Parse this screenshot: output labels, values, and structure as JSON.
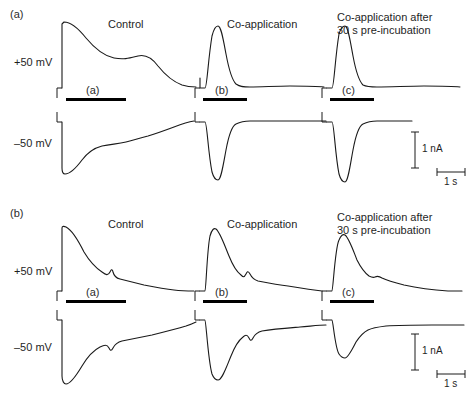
{
  "figure": {
    "width": 473,
    "height": 396,
    "background": "#ffffff",
    "trace_color": "#1a1a1a",
    "bar_color": "#000000"
  },
  "panels": [
    {
      "id": "panel-a",
      "label": "(a)",
      "label_x": 10,
      "label_y": 8,
      "voltage_labels": [
        {
          "text": "+50 mV",
          "x": 14,
          "y": 56
        },
        {
          "text": "–50 mV",
          "x": 14,
          "y": 137
        }
      ],
      "columns": [
        {
          "id": "column-control",
          "title": "Control",
          "title_x": 108,
          "title_y": 18,
          "title_lines": [
            "Control"
          ],
          "application_bar": {
            "x": 66,
            "y": 98,
            "width": 60,
            "label": "(a)",
            "label_x": 86,
            "label_y": 84
          }
        },
        {
          "id": "column-coapplication",
          "title": "Co-application",
          "title_x": 227,
          "title_y": 18,
          "title_lines": [
            "Co-application"
          ],
          "application_bar": {
            "x": 203,
            "y": 98,
            "width": 44,
            "label": "(b)",
            "label_x": 215,
            "label_y": 84
          }
        },
        {
          "id": "column-coapplication-preincubation",
          "title": "Co-application after 30 s pre-incubation",
          "title_x": 337,
          "title_y": 11,
          "title_lines": [
            "Co-application after",
            "30 s pre-incubation"
          ],
          "application_bar": {
            "x": 330,
            "y": 98,
            "width": 44,
            "label": "(c)",
            "label_x": 342,
            "label_y": 84
          }
        }
      ],
      "scale_bars": {
        "current": {
          "label": "1 nA",
          "x": 415,
          "y1": 132,
          "y2": 168,
          "label_x": 422,
          "label_y": 143
        },
        "time": {
          "label": "1 s",
          "x1": 437,
          "x2": 465,
          "y": 172,
          "label_x": 444,
          "label_y": 176
        }
      }
    },
    {
      "id": "panel-b",
      "label": "(b)",
      "label_x": 10,
      "label_y": 207,
      "voltage_labels": [
        {
          "text": "+50 mV",
          "x": 14,
          "y": 265
        },
        {
          "text": "–50 mV",
          "x": 14,
          "y": 341
        }
      ],
      "columns": [
        {
          "id": "column-control",
          "title": "Control",
          "title_x": 108,
          "title_y": 218,
          "title_lines": [
            "Control"
          ],
          "application_bar": {
            "x": 66,
            "y": 300,
            "width": 60,
            "label": "(a)",
            "label_x": 86,
            "label_y": 286
          }
        },
        {
          "id": "column-coapplication",
          "title": "Co-application",
          "title_x": 227,
          "title_y": 218,
          "title_lines": [
            "Co-application"
          ],
          "application_bar": {
            "x": 203,
            "y": 300,
            "width": 44,
            "label": "(b)",
            "label_x": 215,
            "label_y": 286
          }
        },
        {
          "id": "column-coapplication-preincubation",
          "title": "Co-application after 30 s pre-incubation",
          "title_x": 337,
          "title_y": 211,
          "title_lines": [
            "Co-application after",
            "30 s pre-incubation"
          ],
          "application_bar": {
            "x": 330,
            "y": 300,
            "width": 44,
            "label": "(c)",
            "label_x": 342,
            "label_y": 286
          }
        }
      ],
      "scale_bars": {
        "current": {
          "label": "1 nA",
          "x": 415,
          "y1": 334,
          "y2": 370,
          "label_x": 422,
          "label_y": 345
        },
        "time": {
          "label": "1 s",
          "x1": 437,
          "x2": 465,
          "y": 374,
          "label_x": 444,
          "label_y": 378
        }
      }
    }
  ],
  "chart_data": {
    "type": "line",
    "xlabel": "Time",
    "ylabel": "Current",
    "grid": false,
    "legend": null,
    "scale_reference": {
      "current": "1 nA",
      "time": "1 s"
    },
    "annotations": [
      "(a) panel row 1",
      "(b) panel row 2",
      "Application bars labelled (a), (b), (c)"
    ],
    "series": [
      {
        "name": "panel-a-control-plus50",
        "panel": "(a)",
        "column": "Control",
        "holding_potential": "+50 mV",
        "polarity": "outward",
        "baseline_y": 88,
        "peak_y": 22,
        "path": "M 62 88 L 62 24 L 64 22 C 70 22 78 28 86 38 C 96 50 104 56 114 58 C 124 60 130 58 138 56 C 146 54 152 58 158 66 C 166 76 174 82 182 85 C 188 87 190 87 196 87"
      },
      {
        "name": "panel-a-control-minus50",
        "panel": "(a)",
        "column": "Control",
        "holding_potential": "−50 mV",
        "polarity": "inward",
        "baseline_y": 122,
        "peak_y": 174,
        "path": "M 62 122 L 62 168 C 62 172 63 174 65 174 C 70 174 76 168 82 160 C 88 152 94 148 102 146 C 112 144 118 144 126 142 C 134 140 140 138 148 136 C 158 133 166 130 174 127 C 182 124 188 122 194 121"
      },
      {
        "name": "panel-a-coapp-plus50",
        "panel": "(a)",
        "column": "Co-application",
        "holding_potential": "+50 mV",
        "polarity": "outward",
        "baseline_y": 88,
        "peak_y": 26,
        "path": "M 200 88 L 200 78 M 200 88 L 205 88 C 207 88 208 60 212 36 C 214 28 216 26 218 26 C 221 26 223 38 226 54 C 229 70 232 80 236 84 C 240 87 244 87 250 87 C 262 87 276 86 290 86 C 304 86 316 86 324 87"
      },
      {
        "name": "panel-a-coapp-minus50",
        "panel": "(a)",
        "column": "Co-application",
        "holding_potential": "−50 mV",
        "polarity": "inward",
        "baseline_y": 122,
        "peak_y": 180,
        "path": "M 200 122 L 205 122 C 207 122 208 152 212 172 C 214 179 216 180 218 180 C 221 180 223 166 226 150 C 229 134 232 126 236 124 C 240 122 244 121 250 121 C 264 121 280 121 296 121 C 310 121 320 121 326 121"
      },
      {
        "name": "panel-a-preinc-plus50",
        "panel": "(a)",
        "column": "Co-application after 30 s pre-incubation",
        "holding_potential": "+50 mV",
        "polarity": "outward",
        "baseline_y": 88,
        "peak_y": 26,
        "path": "M 327 88 L 332 88 C 334 88 335 58 339 34 C 341 27 343 26 345 26 C 348 26 350 40 353 56 C 356 72 359 81 363 85 C 367 87 371 87 377 87 C 392 87 408 86 424 86 C 440 86 452 86 460 87"
      },
      {
        "name": "panel-a-preinc-minus50",
        "panel": "(a)",
        "column": "Co-application after 30 s pre-incubation",
        "holding_potential": "−50 mV",
        "polarity": "inward",
        "baseline_y": 122,
        "peak_y": 182,
        "path": "M 327 122 L 332 122 C 334 122 335 154 339 174 C 341 181 343 182 345 182 C 348 182 350 166 353 150 C 356 134 359 126 363 124 C 367 122 371 121 377 121 C 392 121 406 121 412 121"
      },
      {
        "name": "panel-b-control-plus50",
        "panel": "(b)",
        "column": "Control",
        "holding_potential": "+50 mV",
        "polarity": "outward",
        "baseline_y": 291,
        "peak_y": 226,
        "path": "M 62 291 L 62 228 C 62 226 64 226 66 227 C 72 230 78 240 84 252 C 90 262 96 268 102 272 C 106 275 108 276 110 272 C 111 270 112 268 113 272 C 114 276 116 278 120 279 C 128 281 136 283 144 285 C 154 287 164 289 174 290 C 182 291 188 291 194 291"
      },
      {
        "name": "panel-b-control-minus50",
        "panel": "(b)",
        "column": "Control",
        "holding_potential": "−50 mV",
        "polarity": "inward",
        "baseline_y": 320,
        "peak_y": 384,
        "path": "M 62 320 L 62 376 C 62 381 64 384 66 384 C 70 384 76 376 82 366 C 88 356 94 350 100 347 C 104 345 107 344 109 348 C 110 350 111 352 113 348 C 115 344 118 342 122 341 C 132 339 142 337 152 335 C 164 332 176 329 186 326 C 192 324 194 323 196 322"
      },
      {
        "name": "panel-b-coapp-plus50",
        "panel": "(b)",
        "column": "Co-application",
        "holding_potential": "+50 mV",
        "polarity": "outward",
        "baseline_y": 291,
        "peak_y": 228,
        "path": "M 200 291 L 205 291 C 206 291 207 250 210 236 C 212 229 214 228 216 229 C 220 232 224 244 229 256 C 233 266 237 272 241 275 C 243 277 244 278 246 274 C 247 272 248 270 250 274 C 252 278 255 280 258 281 C 268 283 278 285 288 286 C 300 288 312 290 322 291"
      },
      {
        "name": "panel-b-coapp-minus50",
        "panel": "(b)",
        "column": "Co-application",
        "holding_potential": "−50 mV",
        "polarity": "inward",
        "baseline_y": 320,
        "peak_y": 380,
        "path": "M 200 320 L 205 320 C 206 320 208 360 212 374 C 214 379 216 380 218 380 C 222 380 226 368 231 356 C 235 346 239 340 243 337 C 245 335 247 334 249 338 C 250 340 251 342 253 338 C 255 334 258 332 262 331 C 274 329 288 328 300 327 C 312 326 320 325 326 325"
      },
      {
        "name": "panel-b-preinc-plus50",
        "panel": "(b)",
        "column": "Co-application after 30 s pre-incubation",
        "holding_potential": "+50 mV",
        "polarity": "outward",
        "baseline_y": 291,
        "peak_y": 234,
        "path": "M 327 291 L 332 291 C 333 291 335 248 339 240 C 341 235 343 234 345 235 C 349 238 353 250 357 260 C 361 268 365 273 369 276 C 371 277 373 278 375 277 C 377 276 379 276 382 278 C 388 281 396 283 404 285 C 418 288 434 290 448 291 C 456 291 460 291 462 291"
      },
      {
        "name": "panel-b-preinc-minus50",
        "panel": "(b)",
        "column": "Co-application after 30 s pre-incubation",
        "holding_potential": "−50 mV",
        "polarity": "inward",
        "baseline_y": 320,
        "peak_y": 358,
        "path": "M 327 320 L 332 320 C 333 320 335 348 339 354 C 341 357 343 358 345 358 C 348 358 352 350 356 342 C 360 336 364 332 368 330 C 372 328 378 327 386 326 C 400 325 416 325 432 325 C 448 325 458 325 464 325"
      }
    ]
  }
}
